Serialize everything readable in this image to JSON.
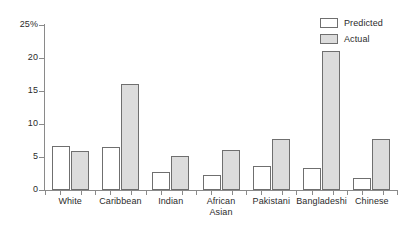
{
  "chart_data": {
    "type": "bar",
    "title": "",
    "subtitle": "",
    "xlabel": "",
    "ylabel": "",
    "ylim": [
      0,
      25
    ],
    "yticks": [
      0,
      5,
      10,
      15,
      20,
      25
    ],
    "ytick_labels": [
      "0",
      "5",
      "10",
      "15",
      "20",
      "25%"
    ],
    "grid": false,
    "legend_position": "top-right",
    "categories": [
      "White",
      "Caribbean",
      "Indian",
      "African\nAsian",
      "Pakistani",
      "Bangladeshi",
      "Chinese"
    ],
    "series": [
      {
        "name": "Predicted",
        "color": "#ffffff",
        "edge_color": "#6f6f6f",
        "values": [
          6.6,
          6.5,
          2.7,
          2.3,
          3.6,
          3.3,
          1.8
        ]
      },
      {
        "name": "Actual",
        "color": "#dcdcdc",
        "edge_color": "#6f6f6f",
        "values": [
          5.9,
          16.1,
          5.2,
          6.0,
          7.8,
          21.0,
          7.7
        ]
      }
    ]
  },
  "legend": {
    "items": [
      {
        "label": "Predicted",
        "swatch": "predicted"
      },
      {
        "label": "Actual",
        "swatch": "actual"
      }
    ]
  },
  "axis": {
    "y_unit_suffix": "%"
  }
}
